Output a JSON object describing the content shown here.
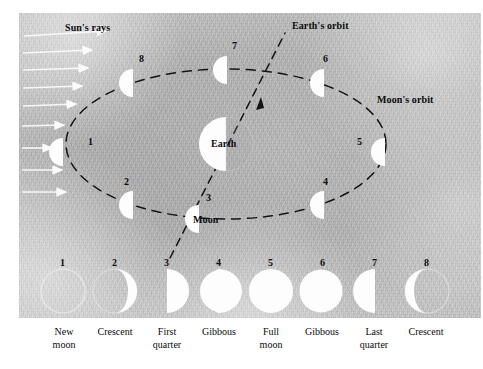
{
  "diagram": {
    "background_color": "#b5b5b5",
    "ink_color": "#111111",
    "lit_color": "#fdfdfd",
    "labels": {
      "suns_rays": "Sun's rays",
      "earths_orbit": "Earth's orbit",
      "moons_orbit": "Moon's orbit",
      "earth": "Earth",
      "moon": "Moon"
    },
    "orbit_positions": [
      {
        "num": "1",
        "label_x": 88,
        "label_y": 143,
        "moon_x": 63,
        "moon_y": 152
      },
      {
        "num": "2",
        "label_x": 124,
        "label_y": 183,
        "moon_x": 133,
        "moon_y": 205
      },
      {
        "num": "3",
        "label_x": 206,
        "label_y": 199,
        "moon_x": 199,
        "moon_y": 219
      },
      {
        "num": "4",
        "label_x": 323,
        "label_y": 183,
        "moon_x": 324,
        "moon_y": 205
      },
      {
        "num": "5",
        "label_x": 357,
        "label_y": 143,
        "moon_x": 385,
        "moon_y": 152
      },
      {
        "num": "6",
        "label_x": 323,
        "label_y": 60,
        "moon_x": 324,
        "moon_y": 83
      },
      {
        "num": "7",
        "label_x": 232,
        "label_y": 47,
        "moon_x": 227,
        "moon_y": 70
      },
      {
        "num": "8",
        "label_x": 139,
        "label_y": 60,
        "moon_x": 133,
        "moon_y": 83
      }
    ],
    "suns_rays_count": 8
  },
  "phase_row": {
    "numbers": [
      "1",
      "2",
      "3",
      "4",
      "5",
      "6",
      "7",
      "8"
    ],
    "phases": [
      {
        "num": "1",
        "name": "New\nmoon",
        "type": "new"
      },
      {
        "num": "2",
        "name": "Crescent",
        "type": "waxing-crescent"
      },
      {
        "num": "3",
        "name": "First\nquarter",
        "type": "first-quarter"
      },
      {
        "num": "4",
        "name": "Gibbous",
        "type": "waxing-gibbous"
      },
      {
        "num": "5",
        "name": "Full\nmoon",
        "type": "full"
      },
      {
        "num": "6",
        "name": "Gibbous",
        "type": "waning-gibbous"
      },
      {
        "num": "7",
        "name": "Last\nquarter",
        "type": "last-quarter"
      },
      {
        "num": "8",
        "name": "Crescent",
        "type": "waning-crescent"
      }
    ]
  }
}
